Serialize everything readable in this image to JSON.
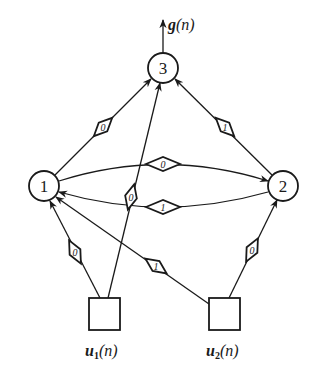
{
  "diagram": {
    "type": "recurrent-neural-network",
    "output_label": "g(n)",
    "output_label_parts": {
      "func": "g",
      "arg": "(n)"
    },
    "neurons": [
      {
        "id": "1",
        "label": "1"
      },
      {
        "id": "2",
        "label": "2"
      },
      {
        "id": "3",
        "label": "3"
      }
    ],
    "inputs": [
      {
        "id": "u1",
        "label": "u1(n)",
        "base": "u",
        "sub": "1",
        "arg": "(n)"
      },
      {
        "id": "u2",
        "label": "u2(n)",
        "base": "u",
        "sub": "2",
        "arg": "(n)"
      }
    ],
    "weights": [
      {
        "from": "1",
        "to": "3",
        "value": "0"
      },
      {
        "from": "u1",
        "to": "3",
        "value": "0"
      },
      {
        "from": "2",
        "to": "3",
        "value": "1"
      },
      {
        "from": "1",
        "to": "2",
        "value": "0"
      },
      {
        "from": "2",
        "to": "1",
        "value": "1"
      },
      {
        "from": "u1",
        "to": "1",
        "value": "0"
      },
      {
        "from": "u2",
        "to": "1",
        "value": "1"
      },
      {
        "from": "u2",
        "to": "2",
        "value": "0"
      }
    ],
    "colors": {
      "stroke": "#1a1a1a",
      "background": "#ffffff"
    }
  }
}
